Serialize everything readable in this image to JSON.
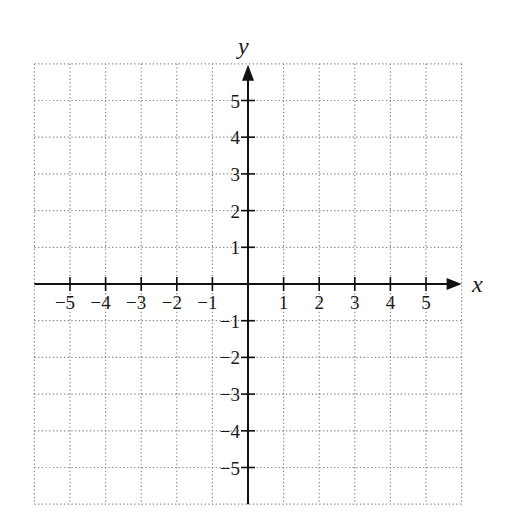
{
  "chart_data": {
    "type": "coordinate-grid",
    "title": "",
    "xlabel": "x",
    "ylabel": "y",
    "xlim": [
      -6,
      6
    ],
    "ylim": [
      -6,
      6
    ],
    "grid": true,
    "grid_style": "dotted",
    "x_ticks": [
      -5,
      -4,
      -3,
      -2,
      -1,
      1,
      2,
      3,
      4,
      5
    ],
    "y_ticks": [
      5,
      4,
      3,
      2,
      1,
      -1,
      -2,
      -3,
      -4,
      -5
    ],
    "x_tick_labels": [
      "−5",
      "−4",
      "−3",
      "−2",
      "−1",
      "1",
      "2",
      "3",
      "4",
      "5"
    ],
    "y_tick_labels": [
      "5",
      "4",
      "3",
      "2",
      "1",
      "−1",
      "−2",
      "−3",
      "−4",
      "−5"
    ],
    "series": []
  },
  "layout": {
    "origin_px": [
      248,
      284
    ],
    "unit_x_px": 35.6,
    "unit_y_px": 36.7,
    "colors": {
      "axis": "#111111",
      "grid": "#8a8a8a",
      "text": "#1a1a1a"
    }
  }
}
